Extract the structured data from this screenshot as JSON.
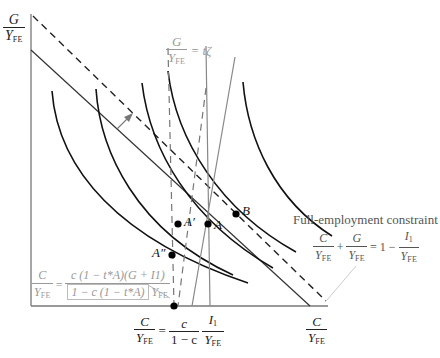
{
  "axes": {
    "y_label": {
      "num": "G",
      "den": "Y",
      "den_sub": "FE"
    },
    "x_label": {
      "num": "C",
      "den": "Y",
      "den_sub": "FE"
    }
  },
  "top_constraint_label": {
    "num": "G",
    "den": "Y",
    "den_sub": "FE",
    "rhs": "= tζ"
  },
  "points": {
    "A": "A",
    "A_prime": "A′",
    "A_double_prime": "A″",
    "B": "B"
  },
  "full_employment": {
    "title": "Full-employment constraint",
    "t1_num": "C",
    "t1_den": "Y",
    "t1_sub": "FE",
    "plus": "+",
    "t2_num": "G",
    "t2_den": "Y",
    "t2_sub": "FE",
    "eq": "= 1 −",
    "t3_num": "I",
    "t3_num_sub": "1",
    "t3_den": "Y",
    "t3_sub": "FE"
  },
  "left_equation": {
    "lhs_num": "C",
    "lhs_den": "Y",
    "lhs_sub": "FE",
    "eq": "=",
    "rhs_num": "c (1 − t*A)(G + I1)",
    "rhs_den_boxed": "1 − c (1 − t*A)",
    "rhs_den_tail": "Y",
    "rhs_den_tail_sub": "FE"
  },
  "bottom_equation": {
    "lhs_num": "C",
    "lhs_den": "Y",
    "lhs_sub": "FE",
    "eq": "=",
    "f1_num": "c",
    "f1_den": "1 − c",
    "f2_num": "I",
    "f2_num_sub": "1",
    "f2_den": "Y",
    "f2_sub": "FE"
  },
  "colors": {
    "curve": "#111111",
    "axis": "#777777",
    "gray_line": "#888888",
    "light_text": "#999999",
    "point": "#000000"
  }
}
